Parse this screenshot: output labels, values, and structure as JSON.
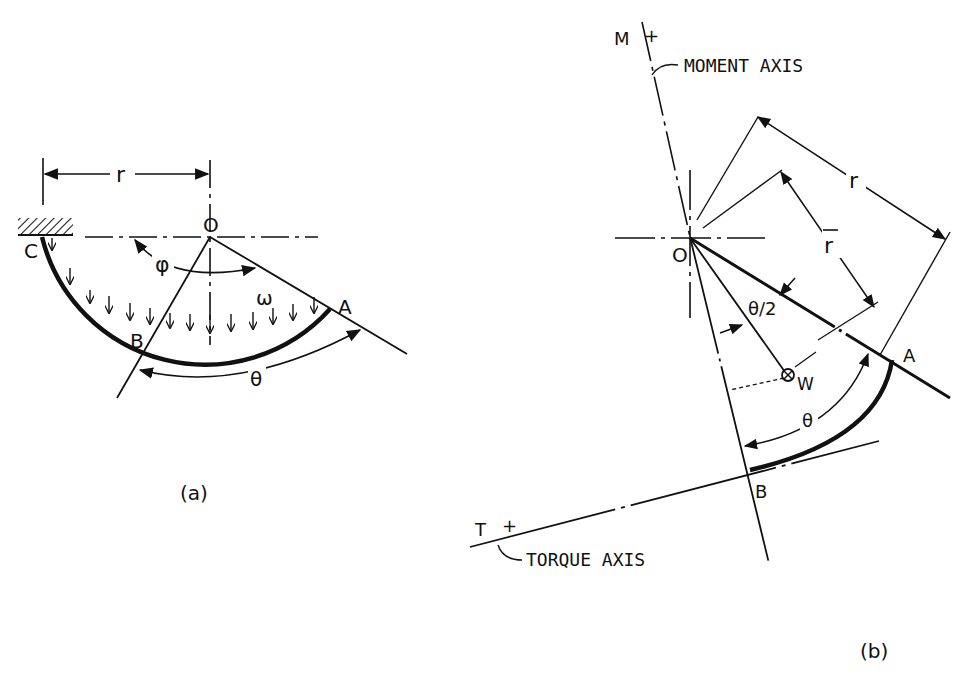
{
  "figure_a": {
    "caption": "(a)",
    "labels": {
      "r": "r",
      "O": "O",
      "C": "C",
      "A": "A",
      "B": "B",
      "phi": "φ",
      "omega": "ω",
      "theta": "θ"
    }
  },
  "figure_b": {
    "caption": "(b)",
    "labels": {
      "M": "M",
      "M_plus": "+",
      "moment_axis": "MOMENT AXIS",
      "r": "r",
      "r_bar": "r",
      "O": "O",
      "theta_half": "θ/2",
      "W": "W",
      "A": "A",
      "theta": "θ",
      "B": "B",
      "T": "T",
      "T_plus": "+",
      "torque_axis": "TORQUE AXIS"
    }
  },
  "colors": {
    "ink": "#111111",
    "background": "#ffffff"
  }
}
